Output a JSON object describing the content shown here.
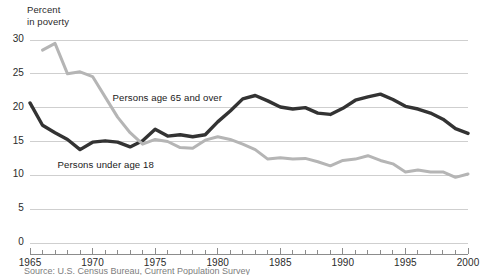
{
  "chart_data": {
    "type": "line",
    "title": "Percent in poverty",
    "title_line1": "Percent",
    "title_line2": "in poverty",
    "xlabel": "",
    "ylabel": "Percent in poverty",
    "xlim": [
      1965,
      2000
    ],
    "ylim": [
      0,
      30
    ],
    "ytick_labels": [
      "0",
      "5",
      "10",
      "15",
      "20",
      "25",
      "30"
    ],
    "yticks": [
      0,
      5,
      10,
      15,
      20,
      25,
      30
    ],
    "xtick_labels": [
      "1965",
      "1970",
      "1975",
      "1980",
      "1985",
      "1990",
      "1995",
      "2000"
    ],
    "xticks": [
      1965,
      1970,
      1975,
      1980,
      1985,
      1990,
      1995,
      2000
    ],
    "grid": true,
    "grid_color": "#cfcfcf",
    "legend": "inline-labels",
    "series": [
      {
        "name": "Persons under age 18",
        "color": "#333333",
        "label_x": 1967.2,
        "label_y": 11.6,
        "x": [
          1965,
          1966,
          1967,
          1968,
          1969,
          1970,
          1971,
          1972,
          1973,
          1974,
          1975,
          1976,
          1977,
          1978,
          1979,
          1980,
          1981,
          1982,
          1983,
          1984,
          1985,
          1986,
          1987,
          1988,
          1989,
          1990,
          1991,
          1992,
          1993,
          1994,
          1995,
          1996,
          1997,
          1998,
          1999,
          2000
        ],
        "values": [
          20.7,
          17.4,
          16.3,
          15.3,
          13.8,
          14.9,
          15.1,
          14.9,
          14.2,
          15.1,
          16.8,
          15.8,
          16.0,
          15.7,
          16.0,
          17.9,
          19.5,
          21.3,
          21.8,
          21.0,
          20.1,
          19.8,
          20.0,
          19.2,
          19.0,
          19.9,
          21.1,
          21.6,
          22.0,
          21.2,
          20.2,
          19.8,
          19.2,
          18.3,
          16.9,
          16.2
        ]
      },
      {
        "name": "Persons age 65 and over",
        "color": "#b5b5b5",
        "label_x": 1971.6,
        "label_y": 21.4,
        "x": [
          1966,
          1967,
          1968,
          1969,
          1970,
          1971,
          1972,
          1973,
          1974,
          1975,
          1976,
          1977,
          1978,
          1979,
          1980,
          1981,
          1982,
          1983,
          1984,
          1985,
          1986,
          1987,
          1988,
          1989,
          1990,
          1991,
          1992,
          1993,
          1994,
          1995,
          1996,
          1997,
          1998,
          1999,
          2000
        ],
        "values": [
          28.5,
          29.5,
          25.0,
          25.3,
          24.6,
          21.6,
          18.6,
          16.3,
          14.6,
          15.3,
          15.0,
          14.1,
          14.0,
          15.2,
          15.7,
          15.3,
          14.6,
          13.8,
          12.4,
          12.6,
          12.4,
          12.5,
          12.0,
          11.4,
          12.2,
          12.4,
          12.9,
          12.2,
          11.7,
          10.5,
          10.8,
          10.5,
          10.5,
          9.7,
          10.2
        ]
      }
    ],
    "footnote": "Source: U.S. Census Bureau, Current Population Survey"
  }
}
